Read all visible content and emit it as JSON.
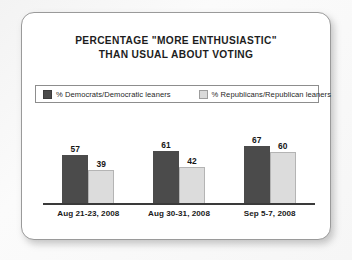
{
  "card": {
    "title_line1": "PERCENTAGE \"MORE ENTHUSIASTIC\"",
    "title_line2": "THAN USUAL ABOUT VOTING"
  },
  "legend": {
    "items": [
      {
        "label": "% Democrats/Democratic leaners",
        "swatch": "dark-swatch",
        "color": "#4b4b4b"
      },
      {
        "label": "% Republicans/Republican leaners",
        "swatch": "light-swatch",
        "color": "#d9d9d9"
      }
    ]
  },
  "chart_data": {
    "type": "bar",
    "title": "PERCENTAGE \"MORE ENTHUSIASTIC\" THAN USUAL ABOUT VOTING",
    "categories": [
      "Aug 21-23, 2008",
      "Aug 30-31, 2008",
      "Sep 5-7, 2008"
    ],
    "series": [
      {
        "name": "% Democrats/Democratic leaners",
        "values": [
          57,
          61,
          67
        ],
        "color": "#4b4b4b"
      },
      {
        "name": "% Republicans/Republican leaners",
        "values": [
          39,
          42,
          60
        ],
        "color": "#d9d9d9"
      }
    ],
    "xlabel": "",
    "ylabel": "",
    "ylim": [
      0,
      80
    ],
    "grid": false,
    "legend_position": "top",
    "value_labels": true,
    "axis_line": "baseline-only"
  }
}
